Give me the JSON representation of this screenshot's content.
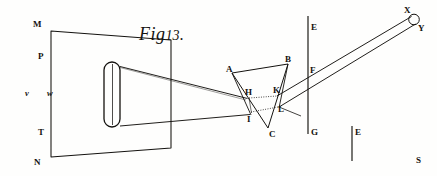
{
  "figure": {
    "title_word": "Fig",
    "title_number": "13",
    "title_dot": ".",
    "caption_full": "Fig 13."
  },
  "colors": {
    "ink": "#14120f",
    "paper": "#fefefd",
    "faint_ink": "#555049"
  },
  "labels": {
    "screen_top": "M",
    "screen_bottom": "N",
    "slit_top": "P",
    "slit_bottom": "T",
    "slit_left": "v",
    "slit_right": "w",
    "prism_a": "A",
    "prism_b": "B",
    "prism_c": "C",
    "ray_h": "H",
    "ray_i": "I",
    "ray_k": "K",
    "ray_l": "L",
    "plane_e_top": "E",
    "plane_f": "F",
    "plane_g": "G",
    "plane_e_second": "E",
    "image_x": "X",
    "image_y": "Y",
    "marker_s": "S"
  },
  "geometry": {
    "screen_quad": "51,31 171,40 171,148 51,157",
    "slit_rect": {
      "x": 104,
      "y": 62,
      "w": 16,
      "h": 65,
      "rx": 8
    },
    "prism_triangle": "232,73 288,64 268,128",
    "ray_upper_from": "120,66",
    "ray_upper_to": "247,98",
    "ray_lower_from": "120,126",
    "ray_lower_to": "250,115",
    "plane_line_main": "308,16 308,134",
    "plane_line_second": "352,126 352,162",
    "image_circle": {
      "cx": 414,
      "cy": 19,
      "r": 5.2
    },
    "exit_ray_upper": "250,100 411,16",
    "exit_ray_lower": "252,112 415,24"
  }
}
